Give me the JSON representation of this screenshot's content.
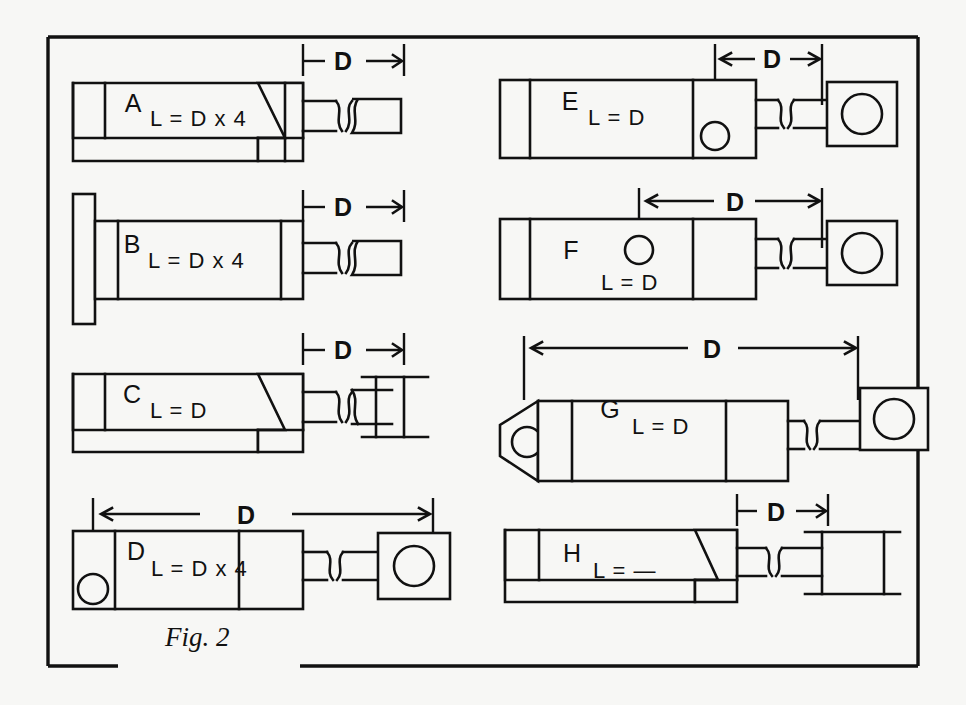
{
  "figure": {
    "caption": "Fig. 2",
    "background_color": "#f7f7f5",
    "line_color": "#111111",
    "dimension_symbol": "D"
  },
  "items": [
    {
      "id": "A",
      "letter": "A",
      "formula": "L = D x 4",
      "dimension_label": "D",
      "dimension_style": "short-bracket",
      "body_style": "stepped-foot",
      "end_fitting": "broken-rod-stub",
      "column": "left",
      "row": 1
    },
    {
      "id": "B",
      "letter": "B",
      "formula": "L = D x 4",
      "dimension_label": "D",
      "dimension_style": "short-bracket",
      "body_style": "front-flange",
      "end_fitting": "broken-rod-stub",
      "column": "left",
      "row": 2
    },
    {
      "id": "C",
      "letter": "C",
      "formula": "L = D",
      "dimension_label": "D",
      "dimension_style": "short-bracket",
      "body_style": "stepped-foot",
      "end_fitting": "i-beam-clevis",
      "column": "left",
      "row": 3
    },
    {
      "id": "D",
      "letter": "D",
      "formula": "L = D x 4",
      "dimension_label": "D",
      "dimension_style": "long-double-arrow",
      "body_style": "rear-pivot-eye",
      "end_fitting": "square-block-eye",
      "column": "left",
      "row": 4
    },
    {
      "id": "E",
      "letter": "E",
      "formula": "L = D",
      "dimension_label": "D",
      "dimension_style": "short-arrow",
      "body_style": "front-trunnion-eye",
      "end_fitting": "square-block-eye",
      "column": "right",
      "row": 1
    },
    {
      "id": "F",
      "letter": "F",
      "formula": "L = D",
      "dimension_label": "D",
      "dimension_style": "medium-double-arrow",
      "body_style": "mid-trunnion-eye",
      "end_fitting": "square-block-eye",
      "column": "right",
      "row": 2
    },
    {
      "id": "G",
      "letter": "G",
      "formula": "L = D",
      "dimension_label": "D",
      "dimension_style": "long-double-arrow",
      "body_style": "tapered-rear-eye",
      "end_fitting": "square-block-eye",
      "column": "right",
      "row": 3
    },
    {
      "id": "H",
      "letter": "H",
      "formula": "L = —",
      "dimension_label": "D",
      "dimension_style": "short-bracket",
      "body_style": "stepped-foot",
      "end_fitting": "rectangular-flange-block",
      "column": "right",
      "row": 4
    }
  ]
}
